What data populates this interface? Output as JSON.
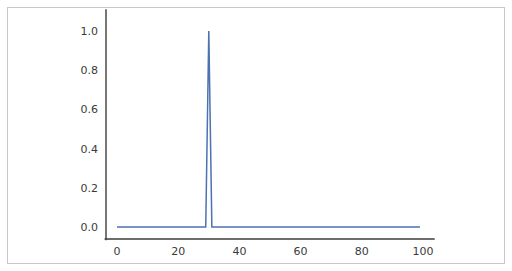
{
  "figure": {
    "background_color": "#ffffff",
    "border_color": "#c9c9c9"
  },
  "chart_data": {
    "type": "line",
    "title": "",
    "xlabel": "",
    "ylabel": "",
    "xlim": [
      -4,
      104
    ],
    "ylim": [
      -0.06,
      1.12
    ],
    "xticks": [
      0,
      20,
      40,
      60,
      80,
      100
    ],
    "xtick_labels": [
      "0",
      "20",
      "40",
      "60",
      "80",
      "100"
    ],
    "yticks": [
      0.0,
      0.2,
      0.4,
      0.6,
      0.8,
      1.0
    ],
    "ytick_labels": [
      "0.0",
      "0.2",
      "0.4",
      "0.6",
      "0.8",
      "1.0"
    ],
    "grid": false,
    "legend": false,
    "legend_position": "none",
    "series": [
      {
        "name": "impulse",
        "color": "#4c72b0",
        "linewidth": 1.5,
        "description": "Unit impulse: zero everywhere except a single sample of value 1.0 at x = 30",
        "x": [
          0,
          1,
          2,
          3,
          4,
          5,
          6,
          7,
          8,
          9,
          10,
          11,
          12,
          13,
          14,
          15,
          16,
          17,
          18,
          19,
          20,
          21,
          22,
          23,
          24,
          25,
          26,
          27,
          28,
          29,
          30,
          31,
          32,
          33,
          34,
          35,
          36,
          37,
          38,
          39,
          40,
          41,
          42,
          43,
          44,
          45,
          46,
          47,
          48,
          49,
          50,
          51,
          52,
          53,
          54,
          55,
          56,
          57,
          58,
          59,
          60,
          61,
          62,
          63,
          64,
          65,
          66,
          67,
          68,
          69,
          70,
          71,
          72,
          73,
          74,
          75,
          76,
          77,
          78,
          79,
          80,
          81,
          82,
          83,
          84,
          85,
          86,
          87,
          88,
          89,
          90,
          91,
          92,
          93,
          94,
          95,
          96,
          97,
          98,
          99
        ],
        "y": [
          0,
          0,
          0,
          0,
          0,
          0,
          0,
          0,
          0,
          0,
          0,
          0,
          0,
          0,
          0,
          0,
          0,
          0,
          0,
          0,
          0,
          0,
          0,
          0,
          0,
          0,
          0,
          0,
          0,
          0,
          1.0,
          0,
          0,
          0,
          0,
          0,
          0,
          0,
          0,
          0,
          0,
          0,
          0,
          0,
          0,
          0,
          0,
          0,
          0,
          0,
          0,
          0,
          0,
          0,
          0,
          0,
          0,
          0,
          0,
          0,
          0,
          0,
          0,
          0,
          0,
          0,
          0,
          0,
          0,
          0,
          0,
          0,
          0,
          0,
          0,
          0,
          0,
          0,
          0,
          0,
          0,
          0,
          0,
          0,
          0,
          0,
          0,
          0,
          0,
          0,
          0,
          0,
          0,
          0,
          0,
          0,
          0,
          0,
          0,
          0
        ]
      }
    ],
    "peak": {
      "x": 30,
      "y": 1.0
    }
  }
}
